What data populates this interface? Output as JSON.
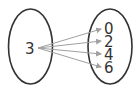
{
  "diagram": {
    "type": "mapping",
    "domain": {
      "values": [
        "3"
      ]
    },
    "codomain": {
      "values": [
        "0",
        "2",
        "4",
        "6"
      ]
    },
    "arrows": [
      {
        "from": "3",
        "to": "0"
      },
      {
        "from": "3",
        "to": "2"
      },
      {
        "from": "3",
        "to": "4"
      },
      {
        "from": "3",
        "to": "6"
      }
    ],
    "colors": {
      "ellipse": "#333333",
      "arrow": "#a0a0a0",
      "text": "#333333"
    }
  }
}
